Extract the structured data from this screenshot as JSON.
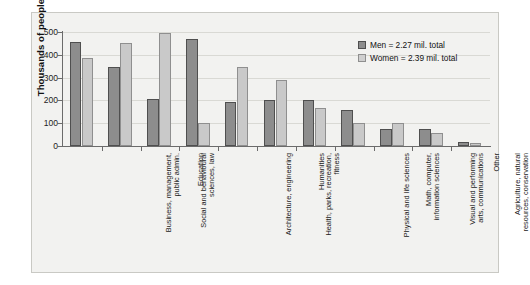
{
  "chart_data": {
    "type": "bar",
    "title": "",
    "xlabel": "",
    "ylabel": "Thousands of people",
    "ylim": [
      0,
      500
    ],
    "yticks": [
      0,
      100,
      200,
      300,
      400,
      500
    ],
    "ytick_labels": [
      "0",
      "100",
      "200",
      "300",
      "400",
      "500"
    ],
    "grid": true,
    "legend_position": "top-right",
    "categories": [
      "Business, management,\npublic admin.",
      "Social and behavioural\nsciences, law",
      "Education",
      "Architecture, engineering",
      "Health, parks, recreation,\nfitness",
      "Humanities",
      "Physical and life sciences",
      "Math, computer,\ninformation sciences",
      "Visual and performing\narts, communications",
      "Agriculture, natural\nresources, conservation",
      "Other"
    ],
    "series": [
      {
        "name": "Men = 2.27 mil. total",
        "short_name": "Men",
        "color": "#8d8d8d",
        "values": [
          458,
          345,
          207,
          470,
          192,
          203,
          203,
          158,
          73,
          75,
          18
        ]
      },
      {
        "name": "Women = 2.39 mil. total",
        "short_name": "Women",
        "color": "#c9c9c9",
        "values": [
          388,
          450,
          495,
          103,
          348,
          290,
          165,
          100,
          103,
          58,
          15
        ]
      }
    ]
  },
  "legend": {
    "items": [
      {
        "label": "Men = 2.27 mil. total",
        "swatch": "men-swatch"
      },
      {
        "label": "Women = 2.39 mil. total",
        "swatch": "women-swatch"
      }
    ]
  },
  "axes": {
    "y_title": "Thousands of people"
  }
}
